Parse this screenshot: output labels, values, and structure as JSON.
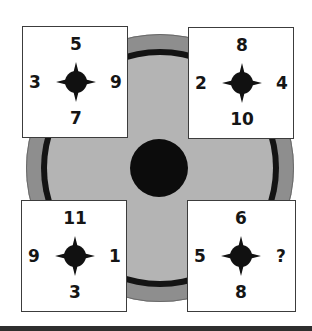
{
  "puzzle": {
    "colors": {
      "outer_ring": "#8e8e8e",
      "black_ring": "#141414",
      "inner_disc": "#b4b4b4",
      "center_dot": "#0c0c0c",
      "card_bg": "#ffffff",
      "text": "#151515"
    },
    "cards": [
      {
        "position": "top-left",
        "top": "5",
        "left": "3",
        "right": "9",
        "bottom": "7",
        "icon": "compass-star-icon"
      },
      {
        "position": "top-right",
        "top": "8",
        "left": "2",
        "right": "4",
        "bottom": "10",
        "icon": "compass-star-icon"
      },
      {
        "position": "bottom-left",
        "top": "11",
        "left": "9",
        "right": "1",
        "bottom": "3",
        "icon": "compass-star-icon"
      },
      {
        "position": "bottom-right",
        "top": "6",
        "left": "5",
        "right": "?",
        "bottom": "8",
        "icon": "compass-star-icon"
      }
    ]
  }
}
